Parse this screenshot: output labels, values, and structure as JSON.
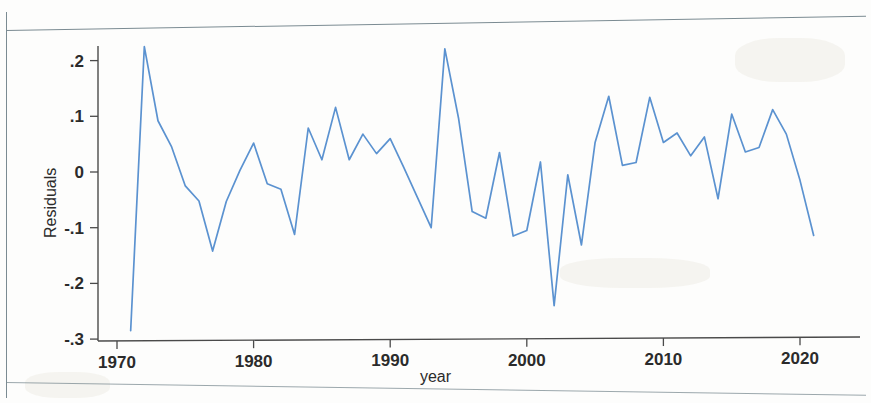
{
  "figure": {
    "kind": "scanned-statistical-plot",
    "line_color": "#5b92d0",
    "axis_color": "#4a4a4a",
    "background": "#ffffff"
  },
  "axes": {
    "y_title": "Residuals",
    "x_title": "year",
    "y_tick_labels": [
      ".2",
      ".1",
      "0",
      "-.1",
      "-.2",
      "-.3"
    ],
    "y_tick_values": [
      0.2,
      0.1,
      0,
      -0.1,
      -0.2,
      -0.3
    ],
    "x_tick_labels": [
      "1970",
      "1980",
      "1990",
      "2000",
      "2010",
      "2020"
    ],
    "x_tick_values": [
      1970,
      1980,
      1990,
      2000,
      2010,
      2020
    ]
  },
  "chart_data": {
    "type": "line",
    "title": "",
    "subtitle": "",
    "xlabel": "year",
    "ylabel": "Residuals",
    "xlim": [
      1970,
      2021.5
    ],
    "ylim": [
      -0.3,
      0.24
    ],
    "grid": false,
    "legend": null,
    "series": [
      {
        "name": "Residuals",
        "color": "#5b92d0",
        "x": [
          1971,
          1972,
          1973,
          1974,
          1975,
          1976,
          1977,
          1978,
          1979,
          1980,
          1981,
          1982,
          1983,
          1984,
          1985,
          1986,
          1987,
          1988,
          1989,
          1990,
          1991,
          1992,
          1993,
          1994,
          1995,
          1996,
          1997,
          1998,
          1999,
          2000,
          2001,
          2002,
          2003,
          2004,
          2005,
          2006,
          2007,
          2008,
          2009,
          2010,
          2011,
          2012,
          2013,
          2014,
          2015,
          2016,
          2017,
          2018,
          2019,
          2020,
          2021
        ],
        "values": [
          -0.285,
          0.225,
          0.092,
          0.045,
          -0.025,
          -0.052,
          -0.142,
          -0.053,
          0.003,
          0.052,
          -0.021,
          -0.031,
          -0.112,
          0.079,
          0.022,
          0.116,
          0.022,
          0.068,
          0.033,
          0.06,
          0.008,
          -0.046,
          -0.1,
          0.221,
          0.097,
          -0.071,
          -0.083,
          0.035,
          -0.115,
          -0.105,
          0.018,
          -0.24,
          -0.005,
          -0.131,
          0.053,
          0.136,
          0.012,
          0.017,
          0.134,
          0.053,
          0.07,
          0.029,
          0.063,
          -0.048,
          0.104,
          0.036,
          0.044,
          0.112,
          0.068,
          -0.015,
          -0.114
        ]
      }
    ]
  }
}
